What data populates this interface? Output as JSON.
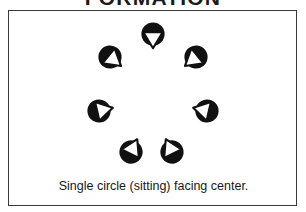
{
  "title": "FORMATION",
  "panel": {
    "caption": "Single circle (sitting) facing center.",
    "border_color": "#3a3a40",
    "background_color": "#ffffff"
  },
  "diagram": {
    "type": "formation-diagram",
    "shape": "single circle",
    "facing": "center",
    "person_count": 7,
    "figure_fill_color": "#111111",
    "figure_body_color": "#ffffff",
    "center": {
      "x": 144,
      "y": 78
    },
    "radius": 55,
    "figures": [
      {
        "name": "person-top",
        "x": 144,
        "y": 23,
        "rotation": 0,
        "position_label": "top",
        "faces": "down"
      },
      {
        "name": "person-upper-right",
        "x": 187,
        "y": 46,
        "rotation": 51,
        "position_label": "upper-right",
        "faces": "lower-left"
      },
      {
        "name": "person-right",
        "x": 198,
        "y": 100,
        "rotation": 103,
        "position_label": "right",
        "faces": "left"
      },
      {
        "name": "person-lower-right",
        "x": 163,
        "y": 141,
        "rotation": 154,
        "position_label": "lower-right",
        "faces": "upper-left"
      },
      {
        "name": "person-lower-left",
        "x": 122,
        "y": 141,
        "rotation": 206,
        "position_label": "lower-left",
        "faces": "upper-right"
      },
      {
        "name": "person-left",
        "x": 90,
        "y": 100,
        "rotation": 257,
        "position_label": "left",
        "faces": "right"
      },
      {
        "name": "person-upper-left",
        "x": 101,
        "y": 46,
        "rotation": 309,
        "position_label": "upper-left",
        "faces": "lower-right"
      }
    ]
  }
}
